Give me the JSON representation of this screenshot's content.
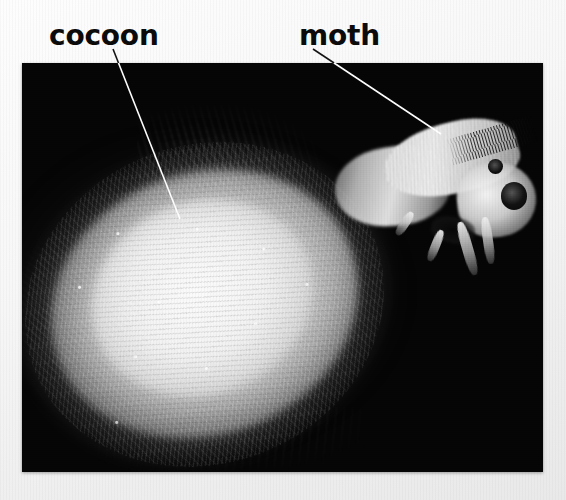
{
  "page": {
    "background_color": "#f4f4f4",
    "width": 566,
    "height": 500
  },
  "figure": {
    "kind": "photograph",
    "background_color": "#000000",
    "frame": {
      "left": 22,
      "top": 63,
      "width": 521,
      "height": 409
    }
  },
  "labels": [
    {
      "id": "cocoon",
      "text": "cocoon",
      "color": "#0b0b0b",
      "leader_line": {
        "x1": 113,
        "y1": 49,
        "x2": 180,
        "y2": 219,
        "color": "#ffffff"
      }
    },
    {
      "id": "moth",
      "text": "moth",
      "color": "#0b0b0b",
      "leader_line": {
        "x1": 313,
        "y1": 49,
        "x2": 441,
        "y2": 134,
        "color": "#ffffff"
      }
    }
  ],
  "photo_elements": {
    "cocoon_label": "cocoon-silk-mass",
    "moth_label": "emerging-moth",
    "moth_eye_label": "moth-compound-eye"
  }
}
